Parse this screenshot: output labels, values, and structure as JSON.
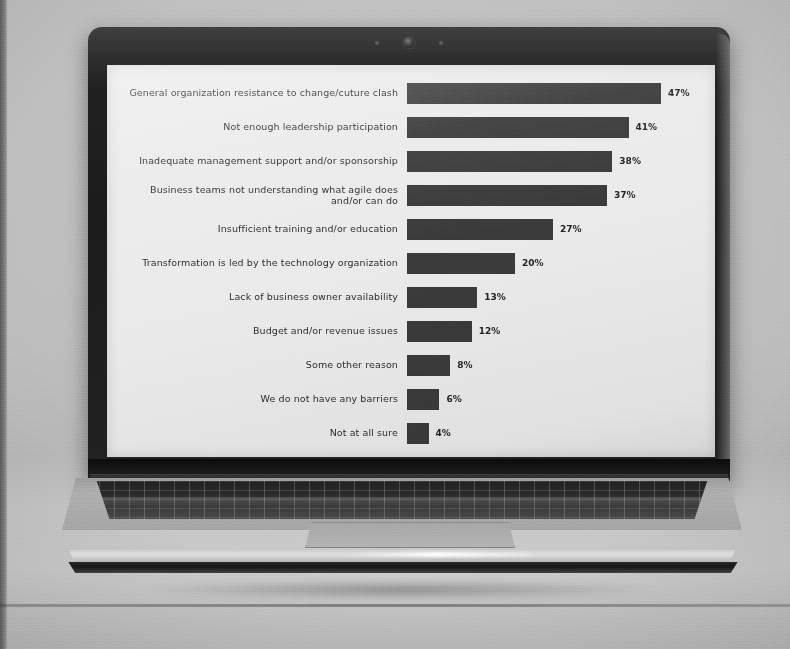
{
  "scene": {
    "device": "laptop",
    "description": "photograph of an open laptop displaying a horizontal bar chart"
  },
  "bezel": {
    "webcam_icon": "camera-icon",
    "mic_left_icon": "microphone-icon",
    "mic_right_icon": "ambient-light-sensor-icon"
  },
  "chart_data": {
    "type": "bar",
    "orientation": "horizontal",
    "title": "",
    "subtitle": "",
    "xlabel": "",
    "ylabel": "",
    "grid": false,
    "legend": false,
    "xlim": [
      0,
      50
    ],
    "value_suffix": "%",
    "bar_color": "#3b3b3b",
    "background_color": "#e9e9e6",
    "label_color": "#2e2e2e",
    "categories": [
      "General organization resistance to change/cuture clash",
      "Not enough leadership participation",
      "Inadequate management support and/or sponsorship",
      "Business teams not understanding what agile does\nand/or can do",
      "Insufficient training and/or education",
      "Transformation is led by the technology organization",
      "Lack of business owner availability",
      "Budget and/or revenue issues",
      "Some other reason",
      "We do not have any barriers",
      "Not at all sure"
    ],
    "values": [
      47,
      41,
      38,
      37,
      27,
      20,
      13,
      12,
      8,
      6,
      4
    ],
    "value_labels": [
      "47%",
      "41%",
      "38%",
      "37%",
      "27%",
      "20%",
      "13%",
      "12%",
      "8%",
      "6%",
      "4%"
    ]
  }
}
